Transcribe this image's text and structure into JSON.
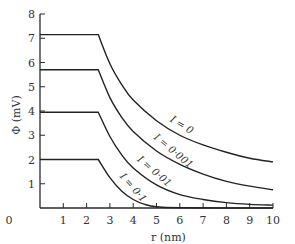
{
  "chart_data": {
    "type": "line",
    "title": "",
    "xlabel": "r (nm)",
    "ylabel": "Φ (mV)",
    "xlim": [
      0,
      10
    ],
    "ylim": [
      0,
      8
    ],
    "xticks": [
      0,
      1,
      2,
      3,
      4,
      5,
      6,
      7,
      8,
      9,
      10
    ],
    "yticks": [
      1,
      2,
      3,
      4,
      5,
      6,
      7,
      8
    ],
    "x_tick_labels": [
      "0",
      "1",
      "2",
      "3",
      "4",
      "5",
      "6",
      "7",
      "8",
      "9",
      "10"
    ],
    "y_tick_labels": [
      "1",
      "2",
      "3",
      "4",
      "5",
      "6",
      "7",
      "8"
    ],
    "origin_label": "0",
    "grid": false,
    "legend": "inline-labels",
    "series": [
      {
        "name": "I = 0",
        "label": "I = 0",
        "plateau": 7.15,
        "plateau_end_r": 2.5,
        "points": [
          [
            0,
            7.15
          ],
          [
            2.5,
            7.15
          ],
          [
            3,
            5.95
          ],
          [
            3.5,
            5.1
          ],
          [
            4,
            4.45
          ],
          [
            5,
            3.6
          ],
          [
            6,
            3.0
          ],
          [
            7,
            2.6
          ],
          [
            8,
            2.3
          ],
          [
            9,
            2.05
          ],
          [
            10,
            1.9
          ]
        ]
      },
      {
        "name": "I = 0.001",
        "label": "I = 0·001",
        "plateau": 5.7,
        "plateau_end_r": 2.5,
        "points": [
          [
            0,
            5.7
          ],
          [
            2.5,
            5.7
          ],
          [
            3,
            4.55
          ],
          [
            3.5,
            3.75
          ],
          [
            4,
            3.15
          ],
          [
            5,
            2.35
          ],
          [
            6,
            1.8
          ],
          [
            7,
            1.4
          ],
          [
            8,
            1.1
          ],
          [
            9,
            0.9
          ],
          [
            10,
            0.75
          ]
        ]
      },
      {
        "name": "I = 0.01",
        "label": "I = 0·01",
        "plateau": 3.95,
        "plateau_end_r": 2.5,
        "points": [
          [
            0,
            3.95
          ],
          [
            2.5,
            3.95
          ],
          [
            3,
            2.95
          ],
          [
            3.5,
            2.2
          ],
          [
            4,
            1.65
          ],
          [
            5,
            0.95
          ],
          [
            6,
            0.55
          ],
          [
            7,
            0.35
          ],
          [
            8,
            0.22
          ],
          [
            9,
            0.15
          ],
          [
            10,
            0.12
          ]
        ]
      },
      {
        "name": "I = 0.1",
        "label": "I = 0·1",
        "plateau": 2.0,
        "plateau_end_r": 2.5,
        "points": [
          [
            0,
            2.0
          ],
          [
            2.5,
            2.0
          ],
          [
            3,
            1.25
          ],
          [
            3.5,
            0.7
          ],
          [
            4,
            0.35
          ],
          [
            4.5,
            0.15
          ],
          [
            5,
            0.05
          ],
          [
            6,
            0.01
          ],
          [
            10,
            0.0
          ]
        ]
      }
    ]
  }
}
